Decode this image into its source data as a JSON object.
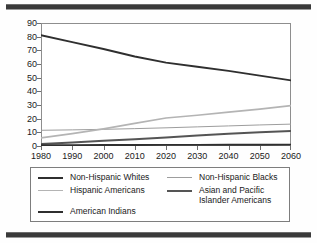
{
  "figure": {
    "top_rule": "horizontal-rule",
    "bottom_rule": "horizontal-rule",
    "background_color": "#ffffff",
    "frame_color": "#8e8e8e"
  },
  "chart_data": {
    "type": "line",
    "title": "",
    "subtitle": "",
    "xlabel": "",
    "ylabel": "",
    "x": [
      1980,
      1990,
      2000,
      2010,
      2020,
      2030,
      2040,
      2050,
      2060
    ],
    "xtick_labels": [
      "1980",
      "1990",
      "2000",
      "2010",
      "2020",
      "2030",
      "2040",
      "2050",
      "2060"
    ],
    "ytick_labels": [
      "0",
      "10",
      "20",
      "30",
      "40",
      "50",
      "60",
      "70",
      "80",
      "90"
    ],
    "xlim": [
      1980,
      2060
    ],
    "ylim": [
      0,
      90
    ],
    "ytick_step": 10,
    "xtick_step": 10,
    "grid": false,
    "legend_position": "below-plot",
    "series": [
      {
        "name": "Non-Hispanic Whites",
        "color": "#2f2f2f",
        "width": 1.9,
        "values": [
          81,
          76,
          71,
          65.5,
          61,
          58,
          55,
          51.5,
          48
        ]
      },
      {
        "name": "Non-Hispanic Blacks",
        "color": "#9d9d9d",
        "width": 1.0,
        "values": [
          11.5,
          11.8,
          12.2,
          12.7,
          13.3,
          14,
          14.7,
          15.4,
          16
        ]
      },
      {
        "name": "Hispanic Americans",
        "color": "#b4b4b4",
        "width": 1.7,
        "values": [
          6,
          9,
          12.5,
          16.5,
          20.5,
          22.5,
          24.8,
          27,
          29.5
        ]
      },
      {
        "name": "Asian and Pacific\nIslander Americans",
        "color": "#555555",
        "width": 2.0,
        "values": [
          1.5,
          2.6,
          3.8,
          5,
          6.3,
          7.6,
          8.9,
          10,
          11
        ]
      },
      {
        "name": "American Indians",
        "color": "#2f2f2f",
        "width": 1.9,
        "values": [
          0.6,
          0.65,
          0.7,
          0.75,
          0.8,
          0.85,
          0.9,
          0.95,
          1
        ]
      }
    ],
    "legend": [
      {
        "label": "Non-Hispanic Whites",
        "color": "#2f2f2f",
        "width": 2.0
      },
      {
        "label": "Hispanic Americans",
        "color": "#b4b4b4",
        "width": 1.8
      },
      {
        "label": "American Indians",
        "color": "#2f2f2f",
        "width": 2.0
      },
      {
        "label": "Non-Hispanic Blacks",
        "color": "#9d9d9d",
        "width": 1.1
      },
      {
        "label": "Asian and Pacific\nIslander Americans",
        "color": "#555555",
        "width": 2.4
      }
    ]
  }
}
